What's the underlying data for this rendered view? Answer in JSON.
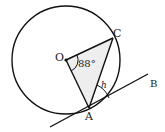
{
  "diagram": {
    "type": "circle-geometry",
    "points": {
      "O": {
        "label": "O",
        "x": 66,
        "y": 60
      },
      "C": {
        "label": "C",
        "x": 113,
        "y": 38
      },
      "A": {
        "label": "A",
        "x": 89,
        "y": 108
      },
      "B": {
        "label": "B"
      }
    },
    "circle": {
      "cx": 66,
      "cy": 60,
      "r": 54
    },
    "angle_label": "88°",
    "tangent_angle_label": "h",
    "colors": {
      "stroke": "#111111",
      "fill": "#eeeeee"
    }
  }
}
